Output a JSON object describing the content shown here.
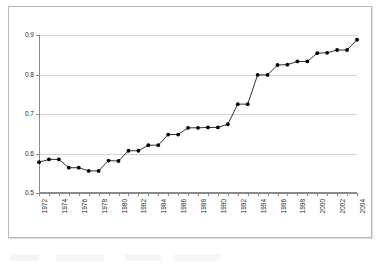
{
  "chart_data": {
    "type": "line",
    "title": "",
    "xlabel": "",
    "ylabel": "",
    "ylim": [
      0.5,
      0.9
    ],
    "yticks": [
      "0.5",
      "0.6",
      "0.7",
      "0.8",
      "0.9"
    ],
    "ytick_values": [
      0.5,
      0.6,
      0.7,
      0.8,
      0.9
    ],
    "xlim": [
      1972,
      2004
    ],
    "grid": true,
    "legend": "none",
    "marker": "filled-circle",
    "line_color": "#1a1a1a",
    "marker_color": "#000000",
    "grid_color": "#d2d2d2",
    "axis_color": "#8a8a8a",
    "x": [
      1972,
      1973,
      1974,
      1975,
      1976,
      1977,
      1978,
      1979,
      1980,
      1981,
      1982,
      1983,
      1984,
      1985,
      1986,
      1987,
      1988,
      1989,
      1990,
      1991,
      1992,
      1993,
      1994,
      1995,
      1996,
      1997,
      1998,
      1999,
      2000,
      2001,
      2002,
      2003,
      2004
    ],
    "values": [
      0.578,
      0.585,
      0.585,
      0.564,
      0.564,
      0.556,
      0.556,
      0.582,
      0.581,
      0.607,
      0.607,
      0.621,
      0.621,
      0.648,
      0.648,
      0.665,
      0.665,
      0.666,
      0.666,
      0.674,
      0.725,
      0.725,
      0.799,
      0.799,
      0.824,
      0.825,
      0.833,
      0.833,
      0.854,
      0.855,
      0.862,
      0.862,
      0.888
    ],
    "xtick_labels": [
      "1972",
      "1974",
      "1976",
      "1978",
      "1980",
      "1982",
      "1984",
      "1986",
      "1988",
      "1990",
      "1992",
      "1994",
      "1996",
      "1998",
      "2000",
      "2002",
      "2004"
    ],
    "xtick_values": [
      1972,
      1974,
      1976,
      1978,
      1980,
      1982,
      1984,
      1986,
      1988,
      1990,
      1992,
      1994,
      1996,
      1998,
      2000,
      2002,
      2004
    ],
    "xtick_rotation": -90
  }
}
